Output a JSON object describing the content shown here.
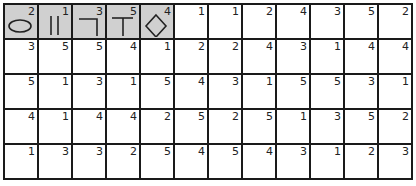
{
  "puzzle": {
    "shape_key": [
      {
        "icon": "ellipse-icon",
        "value": "2"
      },
      {
        "icon": "double-bar-icon",
        "value": "1"
      },
      {
        "icon": "corner-icon",
        "value": "3"
      },
      {
        "icon": "t-shape-icon",
        "value": "5"
      },
      {
        "icon": "diamond-icon",
        "value": "4"
      }
    ],
    "rows": [
      [
        "",
        "",
        "",
        "",
        "",
        "1",
        "1",
        "2",
        "4",
        "3",
        "5",
        "2"
      ],
      [
        "3",
        "5",
        "5",
        "4",
        "1",
        "2",
        "2",
        "4",
        "3",
        "1",
        "4",
        "4"
      ],
      [
        "5",
        "1",
        "3",
        "1",
        "5",
        "4",
        "3",
        "1",
        "5",
        "5",
        "3",
        "1"
      ],
      [
        "4",
        "1",
        "4",
        "4",
        "2",
        "5",
        "2",
        "5",
        "1",
        "3",
        "5",
        "2"
      ],
      [
        "1",
        "3",
        "3",
        "2",
        "5",
        "4",
        "5",
        "4",
        "3",
        "1",
        "2",
        "3"
      ]
    ],
    "colors": {
      "shaded": "#d0d0d0",
      "line": "#1a1a1a"
    }
  }
}
